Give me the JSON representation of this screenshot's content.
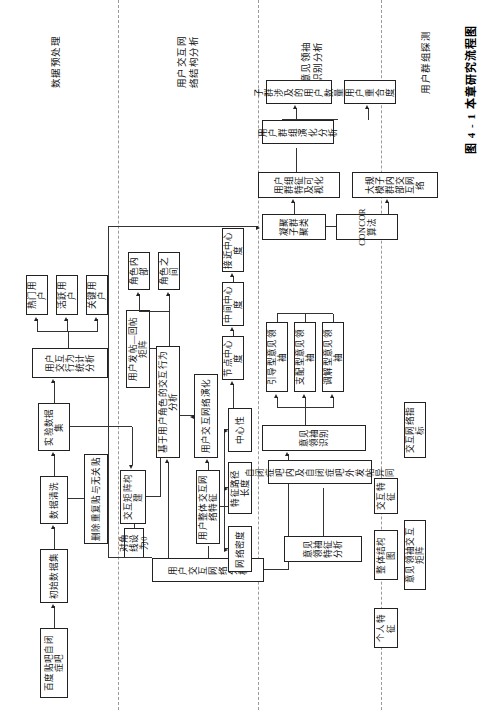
{
  "figure": {
    "caption": "图 4 - 1  本章研究流程图",
    "orientation": "rotated-90-ccw",
    "lanes": [
      {
        "id": "lane-preprocess",
        "title": "数据预处理"
      },
      {
        "id": "lane-network",
        "title": "用户交互网\n络结构分析"
      },
      {
        "id": "lane-opinion",
        "title": "意见领袖\n识别分析"
      },
      {
        "id": "lane-group",
        "title": "用户群组探测"
      }
    ]
  },
  "nodes": {
    "source_tieba": "百度贴吧自闭症吧",
    "raw_dataset": "初始数据集",
    "data_cleaning": "数据清洗",
    "remove_dup": "删除重复贴与无关贴",
    "experiment_dataset": "实验数据集",
    "behavior_stats": "用户交互行为统计分析",
    "key_user": "关键用户",
    "active_user": "活跃用户",
    "hot_user": "热门用户",
    "post_reply_matrix": "用户发帖—回帖矩阵",
    "matrix_build": "交互矩阵构建",
    "diagonal_zero": "对角线设为0",
    "net_analysis": "用户交互网络分析",
    "role_behavior": "基于用户角色的交互行为分析",
    "role_inner": "角色内部",
    "role_between": "角色之间",
    "net_evolution": "用户交互网络演化",
    "overall_net_feature": "用户整体交互网络特征",
    "centrality": "中心性",
    "char_path_len": "特征路径长度",
    "net_density": "网络密度",
    "node_centrality": "节点中心度",
    "betweenness": "中间中心度",
    "closeness": "接近中心度",
    "leader_identify": "意见领袖识别",
    "mediator_leader": "调解型意见领袖",
    "dominant_leader": "支配型意见领袖",
    "guiding_leader": "引导型意见领袖",
    "inside_outside_post": "自闭症吧内及自闭症吧外发帖异同",
    "leader_feature": "意见领袖特征分析",
    "interaction_feature": "交互特征",
    "net_index": "交互网络指标",
    "overall_structure": "整体结构图",
    "personal_feature": "个人特征",
    "leader_matrix": "意见领袖交互矩阵",
    "cohesive_cluster": "凝聚子群聚类",
    "concor": "CONCOR算法",
    "group_feature_vis": "用户群组特征及可视化",
    "large_subgroup_net": "大规模子群内部交互网络",
    "group_evolution": "用户群组演化分析",
    "user_overlap": "用户重合度",
    "subgroup_user_count": "子群涉及的用户数量"
  }
}
